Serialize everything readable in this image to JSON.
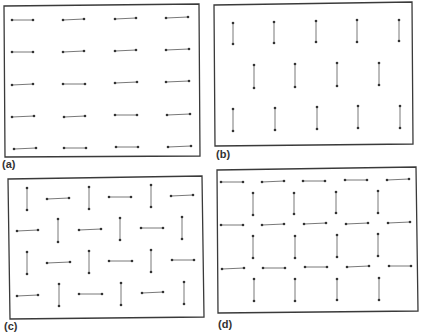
{
  "figure": {
    "colors": {
      "border": "#3a3a3a",
      "dimer": "#555555",
      "dot": "#333333",
      "background": "#ffffff"
    },
    "panels": [
      {
        "id": "a",
        "label": "(a)",
        "label_pos": [
          2,
          158
        ],
        "frame": [
          [
            4,
            6
          ],
          [
            199,
            4
          ],
          [
            200,
            156
          ],
          [
            5,
            157
          ]
        ],
        "dimers": [
          [
            12,
            20,
            33,
            20
          ],
          [
            63,
            20,
            84,
            19
          ],
          [
            115,
            19,
            136,
            18
          ],
          [
            166,
            18,
            188,
            17
          ],
          [
            12,
            52,
            33,
            52
          ],
          [
            63,
            52,
            84,
            51
          ],
          [
            115,
            51,
            136,
            50
          ],
          [
            166,
            50,
            189,
            49
          ],
          [
            12,
            85,
            33,
            84
          ],
          [
            63,
            84,
            85,
            84
          ],
          [
            115,
            83,
            137,
            82
          ],
          [
            166,
            82,
            189,
            81
          ],
          [
            12,
            117,
            34,
            116
          ],
          [
            64,
            117,
            85,
            116
          ],
          [
            115,
            115,
            137,
            115
          ],
          [
            167,
            115,
            190,
            114
          ],
          [
            14,
            149,
            36,
            148
          ],
          [
            64,
            148,
            86,
            148
          ],
          [
            116,
            147,
            138,
            147
          ],
          [
            168,
            147,
            191,
            146
          ]
        ]
      },
      {
        "id": "b",
        "label": "(b)",
        "label_pos": [
          216,
          148
        ],
        "frame": [
          [
            214,
            5
          ],
          [
            412,
            2
          ],
          [
            413,
            144
          ],
          [
            215,
            146
          ]
        ],
        "dimers": [
          [
            233,
            23,
            233,
            44
          ],
          [
            274,
            22,
            274,
            43
          ],
          [
            316,
            21,
            316,
            42
          ],
          [
            357,
            20,
            357,
            42
          ],
          [
            399,
            20,
            399,
            41
          ],
          [
            254,
            65,
            254,
            88
          ],
          [
            295,
            64,
            295,
            87
          ],
          [
            337,
            63,
            337,
            86
          ],
          [
            379,
            63,
            379,
            85
          ],
          [
            233,
            109,
            233,
            131
          ],
          [
            275,
            108,
            275,
            130
          ],
          [
            317,
            107,
            317,
            129
          ],
          [
            358,
            106,
            358,
            128
          ],
          [
            400,
            106,
            400,
            128
          ]
        ]
      },
      {
        "id": "c",
        "label": "(c)",
        "label_pos": [
          4,
          320
        ],
        "frame": [
          [
            8,
            179
          ],
          [
            202,
            176
          ],
          [
            204,
            317
          ],
          [
            10,
            319
          ]
        ],
        "dimers": [
          [
            27,
            188,
            27,
            210
          ],
          [
            47,
            199,
            69,
            198
          ],
          [
            89,
            187,
            89,
            209
          ],
          [
            109,
            197,
            131,
            197
          ],
          [
            151,
            185,
            151,
            207
          ],
          [
            171,
            196,
            193,
            195
          ],
          [
            17,
            231,
            38,
            230
          ],
          [
            58,
            219,
            58,
            242
          ],
          [
            79,
            230,
            101,
            229
          ],
          [
            120,
            218,
            120,
            240
          ],
          [
            141,
            228,
            163,
            228
          ],
          [
            182,
            217,
            182,
            239
          ],
          [
            27,
            252,
            27,
            274
          ],
          [
            47,
            263,
            70,
            262
          ],
          [
            89,
            251,
            89,
            273
          ],
          [
            109,
            261,
            132,
            261
          ],
          [
            151,
            250,
            151,
            272
          ],
          [
            172,
            260,
            194,
            260
          ],
          [
            17,
            296,
            38,
            295
          ],
          [
            59,
            284,
            59,
            306
          ],
          [
            79,
            294,
            102,
            294
          ],
          [
            121,
            283,
            121,
            305
          ],
          [
            142,
            293,
            163,
            292
          ],
          [
            184,
            282,
            184,
            304
          ]
        ]
      },
      {
        "id": "d",
        "label": "(d)",
        "label_pos": [
          218,
          318
        ],
        "frame": [
          [
            217,
            170
          ],
          [
            416,
            167
          ],
          [
            418,
            311
          ],
          [
            218,
            313
          ]
        ],
        "dimers": [
          [
            221,
            182,
            243,
            182
          ],
          [
            262,
            182,
            284,
            181
          ],
          [
            303,
            181,
            325,
            181
          ],
          [
            345,
            180,
            367,
            180
          ],
          [
            387,
            180,
            409,
            179
          ],
          [
            253,
            193,
            253,
            215
          ],
          [
            294,
            193,
            294,
            214
          ],
          [
            336,
            192,
            336,
            213
          ],
          [
            378,
            191,
            378,
            213
          ],
          [
            221,
            225,
            243,
            225
          ],
          [
            262,
            225,
            284,
            224
          ],
          [
            304,
            224,
            326,
            223
          ],
          [
            346,
            224,
            368,
            223
          ],
          [
            388,
            223,
            410,
            222
          ],
          [
            253,
            236,
            253,
            258
          ],
          [
            295,
            236,
            295,
            258
          ],
          [
            337,
            235,
            337,
            257
          ],
          [
            378,
            234,
            378,
            256
          ],
          [
            222,
            269,
            244,
            268
          ],
          [
            263,
            268,
            285,
            268
          ],
          [
            305,
            267,
            327,
            267
          ],
          [
            347,
            267,
            369,
            266
          ],
          [
            389,
            266,
            411,
            266
          ],
          [
            254,
            279,
            254,
            301
          ],
          [
            295,
            279,
            295,
            301
          ],
          [
            337,
            279,
            337,
            300
          ],
          [
            379,
            278,
            379,
            300
          ]
        ]
      }
    ]
  }
}
